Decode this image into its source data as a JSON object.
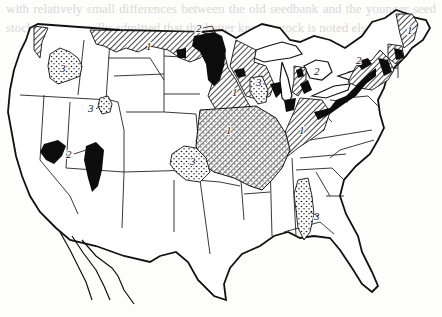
{
  "figure": {
    "type": "map",
    "legend_codes": [
      {
        "code": "1",
        "pattern": "diagonal-hatch"
      },
      {
        "code": "2",
        "pattern": "solid-black"
      },
      {
        "code": "3",
        "pattern": "stippled-dots"
      }
    ],
    "labels": [
      {
        "text": "1",
        "region": "northern-plains-border",
        "x": 148,
        "y": 45
      },
      {
        "text": "1",
        "region": "new-england",
        "x": 415,
        "y": 28
      },
      {
        "text": "1",
        "region": "upper-midwest",
        "x": 232,
        "y": 92
      },
      {
        "text": "1",
        "region": "ohio-valley",
        "x": 300,
        "y": 131
      },
      {
        "text": "1",
        "region": "corn-belt",
        "x": 258,
        "y": 148
      },
      {
        "text": "2",
        "region": "red-river-valley",
        "x": 200,
        "y": 30
      },
      {
        "text": "2",
        "region": "st-lawrence",
        "x": 356,
        "y": 63
      },
      {
        "text": "2",
        "region": "michigan",
        "x": 317,
        "y": 73
      },
      {
        "text": "2",
        "region": "utah-idaho",
        "x": 72,
        "y": 152
      },
      {
        "text": "3",
        "region": "columbia-basin",
        "x": 62,
        "y": 66
      },
      {
        "text": "3",
        "region": "montana",
        "x": 91,
        "y": 110
      },
      {
        "text": "3",
        "region": "wisconsin",
        "x": 257,
        "y": 85
      },
      {
        "text": "3",
        "region": "great-plains",
        "x": 194,
        "y": 162
      },
      {
        "text": "3",
        "region": "mississippi-delta",
        "x": 315,
        "y": 217
      }
    ]
  },
  "bleed_through_text": "with relatively small differences between the old seedbank and the younger seed stock. It is generally admitted that the better known stock is noted elsewhere."
}
